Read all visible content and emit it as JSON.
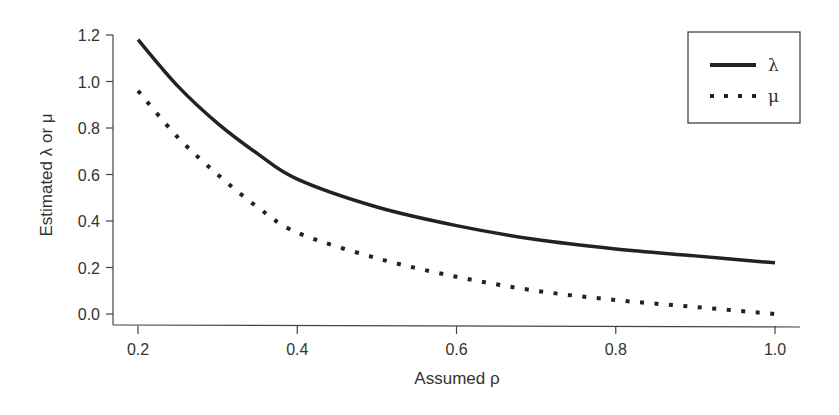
{
  "chart_data": {
    "type": "line",
    "title": "",
    "xlabel": "Assumed ρ",
    "ylabel": "Estimated λ or μ",
    "xlim": [
      0.2,
      1.0
    ],
    "ylim": [
      0.0,
      1.2
    ],
    "x_ticks": [
      "0.2",
      "0.4",
      "0.6",
      "0.8",
      "1.0"
    ],
    "y_ticks": [
      "0.0",
      "0.2",
      "0.4",
      "0.6",
      "0.8",
      "1.0",
      "1.2"
    ],
    "grid": false,
    "legend_position": "top-right",
    "x": [
      0.2,
      0.25,
      0.3,
      0.35,
      0.4,
      0.5,
      0.6,
      0.7,
      0.8,
      0.9,
      1.0
    ],
    "series": [
      {
        "name": "λ",
        "style": "solid",
        "values": [
          1.18,
          0.98,
          0.82,
          0.69,
          0.58,
          0.46,
          0.38,
          0.32,
          0.28,
          0.25,
          0.22
        ]
      },
      {
        "name": "μ",
        "style": "dotted",
        "values": [
          0.96,
          0.76,
          0.6,
          0.46,
          0.35,
          0.24,
          0.16,
          0.1,
          0.06,
          0.03,
          0.0
        ]
      }
    ]
  },
  "legend": {
    "items": [
      {
        "label": "λ"
      },
      {
        "label": "μ"
      }
    ]
  }
}
